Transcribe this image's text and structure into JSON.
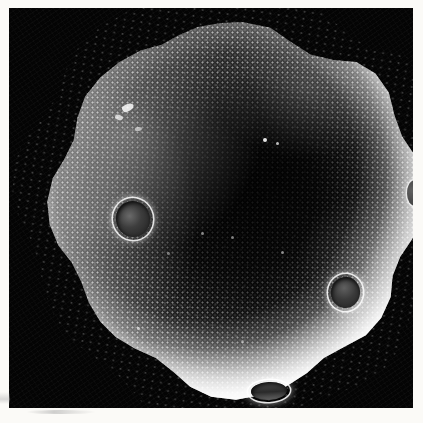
{
  "image": {
    "kind": "sem-micrograph",
    "subject": "pollen grain",
    "caption_visible": "",
    "background_color": "#040404",
    "border_color": "#fbfaf7",
    "frame": {
      "left": 9,
      "top": 8,
      "width": 404,
      "height": 400
    }
  },
  "specimen": {
    "name": "pollen-grain",
    "outline": "lobed-circular",
    "lobe_count": 10,
    "surface_texture": "spinulose-granular",
    "highlight_color": "#ffffff",
    "core_color": "#0a0a0a",
    "diameter_px": 382,
    "center": {
      "x": 227,
      "y": 203
    }
  },
  "features": {
    "pores": [
      {
        "name": "pore-left",
        "label": "germ pore",
        "x": 104,
        "y": 207,
        "diameter_px": 41,
        "shape": "circular"
      },
      {
        "name": "pore-right",
        "label": "germ pore",
        "x": 336,
        "y": 281,
        "diameter_px": 36,
        "shape": "circular"
      },
      {
        "name": "pore-bottom",
        "label": "germ pore",
        "x": 260,
        "y": 379,
        "diameter_px": 42,
        "shape": "elliptical-foreshortened"
      },
      {
        "name": "pore-edge",
        "label": "germ pore",
        "x": 414,
        "y": 193,
        "diameter_px": 26,
        "shape": "clipped-by-frame"
      }
    ],
    "debris": [
      {
        "name": "debris-a",
        "x": 85,
        "y": 88
      },
      {
        "name": "debris-b",
        "x": 74,
        "y": 98
      },
      {
        "name": "debris-c",
        "x": 93,
        "y": 109
      }
    ],
    "specks": [
      {
        "name": "speck-a",
        "x": 220,
        "y": 120
      },
      {
        "name": "speck-b",
        "x": 232,
        "y": 124
      },
      {
        "name": "speck-c",
        "x": 157,
        "y": 213
      },
      {
        "name": "speck-d",
        "x": 187,
        "y": 217
      },
      {
        "name": "speck-e",
        "x": 237,
        "y": 232
      },
      {
        "name": "speck-f",
        "x": 123,
        "y": 233
      },
      {
        "name": "speck-g",
        "x": 93,
        "y": 308
      },
      {
        "name": "speck-h",
        "x": 197,
        "y": 321
      }
    ]
  },
  "lighting": {
    "direction": "upper-left",
    "rim_brightening": "strong",
    "core_shadow": "deep"
  }
}
